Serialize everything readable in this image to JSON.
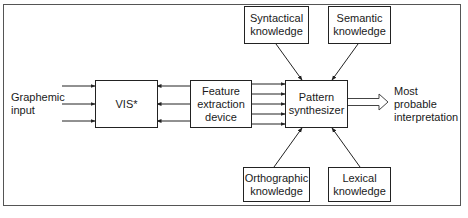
{
  "diagram": {
    "input_label_line1": "Graphemic",
    "input_label_line2": "input",
    "output_label_line1": "Most",
    "output_label_line2": "probable",
    "output_label_line3": "interpretation",
    "nodes": {
      "vis": {
        "line1": "VIS*"
      },
      "feature": {
        "line1": "Feature",
        "line2": "extraction",
        "line3": "device"
      },
      "pattern": {
        "line1": "Pattern",
        "line2": "synthesizer"
      },
      "syntactical": {
        "line1": "Syntactical",
        "line2": "knowledge"
      },
      "semantic": {
        "line1": "Semantic",
        "line2": "knowledge"
      },
      "orthographic": {
        "line1": "Orthographic",
        "line2": "knowledge"
      },
      "lexical": {
        "line1": "Lexical",
        "line2": "knowledge"
      }
    },
    "edges": [
      {
        "from": "graphemic-input",
        "to": "vis",
        "count": 3
      },
      {
        "from": "feature",
        "to": "vis",
        "count": 3
      },
      {
        "from": "feature",
        "to": "pattern",
        "count": 5
      },
      {
        "from": "syntactical",
        "to": "pattern",
        "count": 1
      },
      {
        "from": "semantic",
        "to": "pattern",
        "count": 1
      },
      {
        "from": "orthographic",
        "to": "pattern",
        "count": 1
      },
      {
        "from": "lexical",
        "to": "pattern",
        "count": 1
      },
      {
        "from": "pattern",
        "to": "output",
        "count": 1,
        "style": "hollow-block-arrow"
      }
    ]
  }
}
